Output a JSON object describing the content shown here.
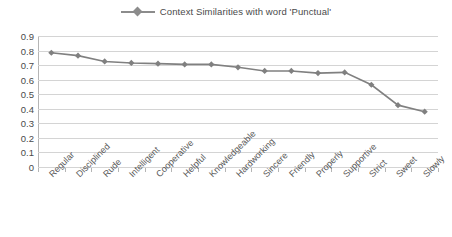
{
  "legend": {
    "marker_icon": "diamond-marker-icon",
    "label": "Context Similarities with word 'Punctual'"
  },
  "colors": {
    "series": "#808080",
    "grid": "#d4d4d4",
    "axis": "#b5b5b5",
    "text": "#4a4a4a",
    "background": "#ffffff"
  },
  "chart_data": {
    "type": "line",
    "title": "",
    "subtitle": "",
    "xlabel": "",
    "ylabel": "",
    "ylim": [
      0,
      0.9
    ],
    "ytick_labels": [
      "0.9",
      "0.8",
      "0.7",
      "0.6",
      "0.5",
      "0.4",
      "0.3",
      "0.2",
      "0.1",
      "0"
    ],
    "ytick_values": [
      0.9,
      0.8,
      0.7,
      0.6,
      0.5,
      0.4,
      0.3,
      0.2,
      0.1,
      0
    ],
    "grid": "horizontal",
    "legend_position": "top-center",
    "marker": "diamond",
    "categories": [
      "Regular",
      "Disciplined",
      "Rude",
      "Intelligent",
      "Cooperative",
      "Helpful",
      "Knowledgeable",
      "Hardworking",
      "Sincere",
      "Friendly",
      "Properly",
      "Supportive",
      "Strict",
      "Sweet",
      "Slowly"
    ],
    "series": [
      {
        "name": "Context Similarities with word 'Punctual'",
        "color": "#808080",
        "values": [
          0.785,
          0.765,
          0.725,
          0.715,
          0.71,
          0.705,
          0.705,
          0.685,
          0.66,
          0.66,
          0.645,
          0.65,
          0.565,
          0.425,
          0.38
        ]
      }
    ]
  }
}
